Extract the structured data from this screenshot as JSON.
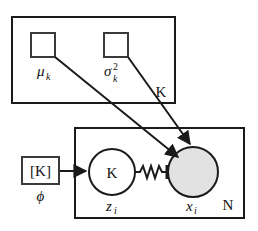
{
  "diagram": {
    "type": "plate-notation-graphical-model",
    "colors": {
      "stroke": "#1a1a1a",
      "observed_node_fill": "#e2e2e2",
      "latent_node_fill": "#ffffff",
      "background": "#ffffff"
    },
    "plates": [
      {
        "id": "plate-k",
        "label": "K",
        "label_position": "bottom-right",
        "x": 12,
        "y": 17,
        "width": 163,
        "height": 86
      },
      {
        "id": "plate-n",
        "label": "N",
        "label_position": "bottom-right",
        "x": 75,
        "y": 128,
        "width": 169,
        "height": 90
      }
    ],
    "param_squares": [
      {
        "id": "mu-k",
        "label_base": "μ",
        "label_sub": "k",
        "label_sup": "",
        "x": 31,
        "y": 33,
        "size": 24
      },
      {
        "id": "sigma2-k",
        "label_base": "σ",
        "label_sub": "k",
        "label_sup": "2",
        "x": 104,
        "y": 33,
        "size": 24
      },
      {
        "id": "phi-box",
        "label_base": "ϕ",
        "label_sub": "",
        "label_sup": "",
        "inner_text": "[K]",
        "x": 22,
        "y": 157,
        "width": 37,
        "height": 27
      }
    ],
    "nodes": [
      {
        "id": "z-i",
        "inner_text": "K",
        "label_base": "z",
        "label_sub": "i",
        "shaded": false,
        "cx": 112,
        "cy": 172,
        "r": 23
      },
      {
        "id": "x-i",
        "inner_text": "",
        "label_base": "x",
        "label_sub": "i",
        "shaded": true,
        "cx": 193,
        "cy": 172,
        "r": 25
      }
    ],
    "edges": [
      {
        "id": "edge-mu-to-x",
        "from": "mu-k",
        "to": "x-i",
        "style": "arrow"
      },
      {
        "id": "edge-sigma-to-x",
        "from": "sigma2-k",
        "to": "x-i",
        "style": "arrow"
      },
      {
        "id": "edge-phi-to-z",
        "from": "phi-box",
        "to": "z-i",
        "style": "arrow"
      },
      {
        "id": "edge-z-to-x",
        "from": "z-i",
        "to": "x-i",
        "style": "wavy"
      }
    ]
  },
  "labels": {
    "plate_k": "K",
    "plate_n": "N",
    "mu_base": "μ",
    "mu_sub": "k",
    "sigma_base": "σ",
    "sigma_sup": "2",
    "sigma_sub": "k",
    "phi": "ϕ",
    "phi_box_text": "[K]",
    "z_base": "z",
    "z_sub": "i",
    "z_inner": "K",
    "x_base": "x",
    "x_sub": "i"
  }
}
